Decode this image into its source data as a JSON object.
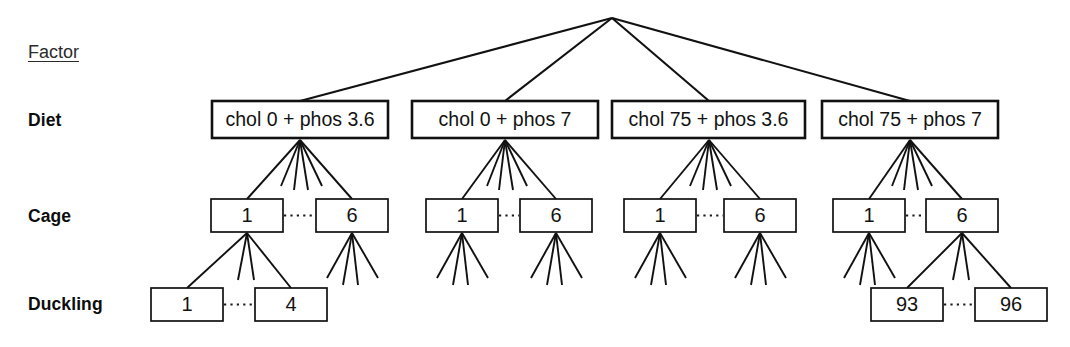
{
  "diagram": {
    "title_label": "Factor",
    "type": "hierarchical-nested-design-tree",
    "rows": [
      {
        "key": "diet",
        "label": "Diet"
      },
      {
        "key": "cage",
        "label": "Cage"
      },
      {
        "key": "duckling",
        "label": "Duckling"
      }
    ],
    "root": {
      "label": ""
    },
    "diet_nodes": [
      {
        "label": "chol 0 + phos 3.6"
      },
      {
        "label": "chol 0 + phos 7"
      },
      {
        "label": "chol 75 + phos 3.6"
      },
      {
        "label": "chol 75 + phos 7"
      }
    ],
    "cage_nodes": [
      {
        "first": "1",
        "last": "6"
      },
      {
        "first": "1",
        "last": "6"
      },
      {
        "first": "1",
        "last": "6"
      },
      {
        "first": "1",
        "last": "6"
      }
    ],
    "duckling_groups": [
      {
        "first": "1",
        "last": "4"
      },
      {
        "first": "93",
        "last": "96"
      }
    ],
    "colors": {
      "line": "#111111",
      "box_fill": "#ffffff",
      "text": "#121212",
      "background": "#ffffff"
    },
    "fan_counts": {
      "root_to_diet": 4,
      "diet_to_cage": 6,
      "cage_to_duckling": 4
    }
  }
}
